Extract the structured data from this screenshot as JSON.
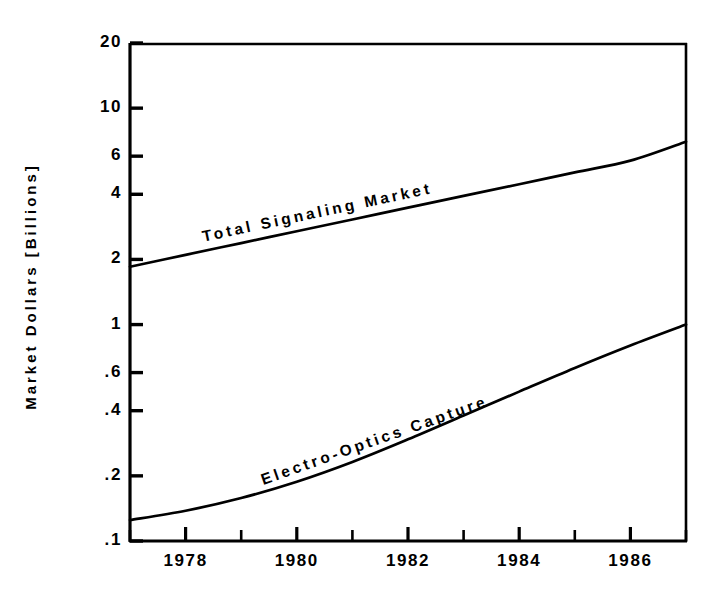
{
  "chart_data": {
    "type": "line",
    "title": "",
    "xlabel": "",
    "ylabel": "Market Dollars [Billions]",
    "yscale": "log",
    "xlim": [
      1977,
      1987
    ],
    "ylim": [
      0.1,
      20
    ],
    "grid": false,
    "legend_position": "inline-curve-labels",
    "y_ticks": [
      "20",
      "10",
      "6",
      "4",
      "2",
      "1",
      ".6",
      ".4",
      ".2",
      ".1"
    ],
    "y_tick_values": [
      20,
      10,
      6,
      4,
      2,
      1,
      0.6,
      0.4,
      0.2,
      0.1
    ],
    "x_ticks": [
      "1978",
      "1980",
      "1982",
      "1984",
      "1986"
    ],
    "x_tick_values": [
      1978,
      1980,
      1982,
      1984,
      1986
    ],
    "x_minor_tick_values": [
      1977,
      1979,
      1981,
      1983,
      1985,
      1987
    ],
    "series": [
      {
        "name": "Total Signaling Market",
        "label": "Total Signaling Market",
        "color": "#000000",
        "x": [
          1977,
          1978,
          1979,
          1980,
          1981,
          1982,
          1983,
          1984,
          1985,
          1986,
          1987
        ],
        "values": [
          1.85,
          2.1,
          2.38,
          2.7,
          3.06,
          3.47,
          3.93,
          4.45,
          5.05,
          5.72,
          7.0
        ]
      },
      {
        "name": "Electro-Optics Capture",
        "label": "Electro-Optics Capture",
        "color": "#000000",
        "x": [
          1977,
          1978,
          1979,
          1980,
          1981,
          1982,
          1983,
          1984,
          1985,
          1986,
          1987
        ],
        "values": [
          0.125,
          0.138,
          0.158,
          0.188,
          0.232,
          0.295,
          0.38,
          0.49,
          0.63,
          0.8,
          1.0
        ]
      }
    ]
  },
  "axes": {
    "y_title": "Market Dollars [Billions]"
  },
  "labels": {
    "series_0": "Total Signaling Market",
    "series_1": "Electro-Optics Capture"
  },
  "colors": {
    "line": "#000000",
    "axis": "#000000",
    "background": "#ffffff"
  }
}
